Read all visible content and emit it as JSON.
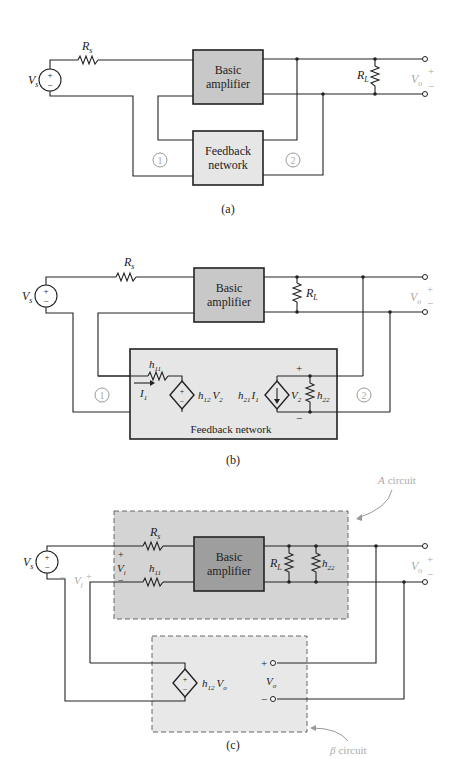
{
  "colors": {
    "amp_fill": "#c8c8c8",
    "fb_fill": "#e6e6e6",
    "a_circuit_fill": "#d4d4d4",
    "amp_dark_fill": "#9e9e9e",
    "beta_fill": "#e8e8e8",
    "line": "#222222",
    "faint_label": "#aaaaaa"
  },
  "panel_a": {
    "caption": "(a)",
    "source": "V",
    "source_sub": "s",
    "rs": "R",
    "rs_sub": "s",
    "amp_line1": "Basic",
    "amp_line2": "amplifier",
    "fb_line1": "Feedback",
    "fb_line2": "network",
    "rl": "R",
    "rl_sub": "L",
    "vo": "V",
    "vo_sub": "o",
    "port1": "1",
    "port2": "2",
    "plus": "+",
    "minus": "−"
  },
  "panel_b": {
    "caption": "(b)",
    "source": "V",
    "source_sub": "s",
    "rs": "R",
    "rs_sub": "s",
    "amp_line1": "Basic",
    "amp_line2": "amplifier",
    "rl": "R",
    "rl_sub": "L",
    "vo": "V",
    "vo_sub": "o",
    "h11": "h",
    "h11_sub": "11",
    "i1": "I",
    "i1_sub": "1",
    "h12v2": "h",
    "h12_sub": "12",
    "v2_a": "V",
    "v2_sub": "2",
    "h21i1": "h",
    "h21_sub": "21",
    "i1b": "I",
    "i1b_sub": "1",
    "v2": "V",
    "v2b_sub": "2",
    "h22": "h",
    "h22_sub": "22",
    "fb_label": "Feedback network",
    "port1": "1",
    "port2": "2",
    "plus": "+",
    "minus": "−"
  },
  "panel_c": {
    "caption": "(c)",
    "a_circuit": "A",
    "a_circuit_word": "circuit",
    "beta_circuit": "β",
    "beta_circuit_word": "circuit",
    "source": "V",
    "source_sub": "s",
    "rs": "R",
    "rs_sub": "s",
    "h11": "h",
    "h11_sub": "11",
    "vi": "V",
    "vi_sub": "i",
    "vf": "V",
    "vf_sub": "f",
    "amp_line1": "Basic",
    "amp_line2": "amplifier",
    "rl": "R",
    "rl_sub": "L",
    "h22": "h",
    "h22_sub": "22",
    "vo": "V",
    "vo_sub": "o",
    "h12vo": "h",
    "h12_sub": "12",
    "vo2": "V",
    "vo2_sub": "o",
    "vo3": "V",
    "vo3_sub": "o",
    "plus": "+",
    "minus": "−"
  }
}
